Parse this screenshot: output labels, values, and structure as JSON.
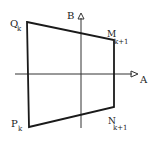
{
  "diagram": {
    "axes": {
      "horizontal_label": "A",
      "vertical_label": "B"
    },
    "vertices": {
      "Q": {
        "name": "Q",
        "sub": "k"
      },
      "M": {
        "name": "M",
        "sub": "k+1"
      },
      "N": {
        "name": "N",
        "sub": "k+1"
      },
      "P": {
        "name": "P",
        "sub": "k"
      }
    },
    "colors": {
      "stroke": "#1a1a1a",
      "axis": "#333333",
      "background": "#ffffff"
    }
  }
}
